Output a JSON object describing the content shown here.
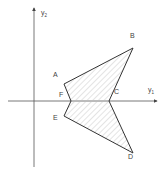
{
  "diagram": {
    "type": "polygon-region-on-axes",
    "axes": {
      "horizontal": {
        "label": "y",
        "subscript": "1"
      },
      "vertical": {
        "label": "y",
        "subscript": "2"
      }
    },
    "vertices": [
      {
        "name": "A",
        "x": 64,
        "y": 84
      },
      {
        "name": "B",
        "x": 133,
        "y": 48
      },
      {
        "name": "C",
        "x": 109,
        "y": 101
      },
      {
        "name": "D",
        "x": 133,
        "y": 153
      },
      {
        "name": "E",
        "x": 64,
        "y": 116
      },
      {
        "name": "F",
        "x": 71,
        "y": 101
      }
    ],
    "labels": {
      "A": "A",
      "B": "B",
      "C": "C",
      "D": "D",
      "E": "E",
      "F": "F"
    },
    "fill": "diagonal hatching",
    "colors": {
      "outline": "#333333",
      "axis": "#555555",
      "hatch": "#bbbbbb"
    }
  }
}
